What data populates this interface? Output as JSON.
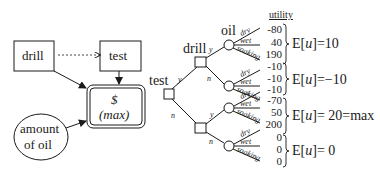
{
  "influence_diagram": {
    "decision_drill": "drill",
    "decision_test": "test",
    "utility_symbol": "$",
    "utility_label": "(max)",
    "chance_line1": "amount",
    "chance_line2": "of oil"
  },
  "tree": {
    "root_label": "test",
    "drill_label": "drill",
    "oil_label": "oil",
    "yes": "y",
    "no": "n",
    "outcomes": [
      "dry",
      "wet",
      "soaking"
    ],
    "utility_header": "utility",
    "groups": [
      {
        "utilities": [
          "-80",
          "40",
          "190"
        ],
        "eu_prefix": "E[",
        "eu_var": "u",
        "eu_suffix": "]=10"
      },
      {
        "utilities": [
          "-10",
          "-10",
          "-10"
        ],
        "eu_prefix": "E[",
        "eu_var": "u",
        "eu_suffix": "]=−10"
      },
      {
        "utilities": [
          "-70",
          "50",
          "200"
        ],
        "eu_prefix": "E[",
        "eu_var": "u",
        "eu_suffix": "]= 20=max"
      },
      {
        "utilities": [
          "0",
          "0",
          "0"
        ],
        "eu_prefix": "E[",
        "eu_var": "u",
        "eu_suffix": "]= 0"
      }
    ]
  }
}
